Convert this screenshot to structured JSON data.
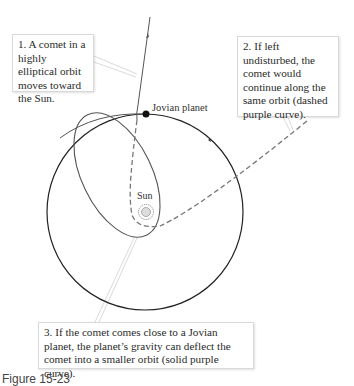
{
  "callouts": [
    {
      "number": 1,
      "text": "1. A comet in a highly elliptical orbit moves toward the Sun."
    },
    {
      "number": 2,
      "text": "2. If left undisturbed, the comet would continue along the same orbit (dashed purple curve)."
    },
    {
      "number": 3,
      "text": "3. If the comet comes close to a Jovian planet, the planet’s gravity can deflect the comet into a smaller orbit (solid purple curve)."
    }
  ],
  "labels": {
    "jovian_planet": "Jovian planet",
    "sun": "Sun"
  },
  "caption": "Figure 15-23",
  "colors": {
    "planet_orbit": "#222222",
    "comet_orbit": "#555555",
    "dashed_orbit": "#777777",
    "leader_line": "#cccccc",
    "callout_border": "#d8d8d8"
  },
  "icons": {
    "sun": "sun-icon",
    "planet": "planet-dot-icon"
  }
}
